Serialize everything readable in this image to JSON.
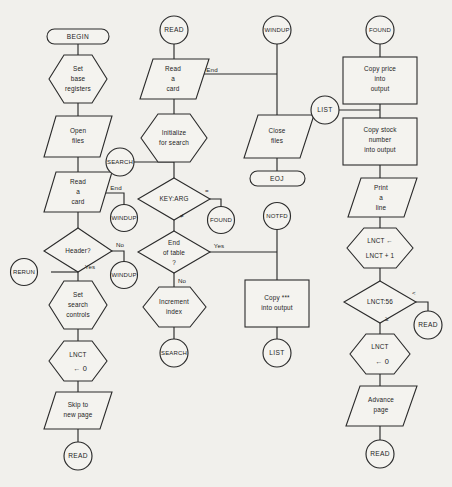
{
  "diagram": {
    "background_color": "#f1f0ec",
    "line_color": "#2b2b2b",
    "shape_fill": "#f4f3ef"
  },
  "columns": [
    {
      "name": "begin-column",
      "nodes": [
        {
          "id": "begin",
          "shape": "terminator",
          "lines": [
            "BEGIN"
          ]
        },
        {
          "id": "set-base-registers",
          "shape": "hexagon",
          "lines": [
            "Set",
            "base",
            "registers"
          ]
        },
        {
          "id": "open-files",
          "shape": "parallelogram",
          "lines": [
            "Open",
            "files"
          ]
        },
        {
          "id": "read-a-card-1",
          "shape": "parallelogram",
          "lines": [
            "Read",
            "a",
            "card"
          ]
        },
        {
          "id": "header-decision",
          "shape": "diamond",
          "lines": [
            "Header?"
          ]
        },
        {
          "id": "rerun",
          "shape": "connector",
          "lines": [
            "RERUN"
          ]
        },
        {
          "id": "windup-1",
          "shape": "connector",
          "lines": [
            "WINDUP"
          ]
        },
        {
          "id": "set-search-controls",
          "shape": "hexagon",
          "lines": [
            "Set",
            "search",
            "controls"
          ]
        },
        {
          "id": "lnct-zero-1",
          "shape": "hexagon",
          "lines": [
            "LNCT",
            "←     0"
          ]
        },
        {
          "id": "skip-to-new-page",
          "shape": "parallelogram",
          "lines": [
            "Skip to",
            "new page"
          ]
        },
        {
          "id": "read-1",
          "shape": "connector",
          "lines": [
            "READ"
          ]
        }
      ],
      "edge_labels": [
        "End",
        "No",
        "Yes"
      ]
    },
    {
      "name": "read-column",
      "nodes": [
        {
          "id": "read-2",
          "shape": "connector",
          "lines": [
            "READ"
          ]
        },
        {
          "id": "read-a-card-2",
          "shape": "parallelogram",
          "lines": [
            "Read",
            "a",
            "card"
          ]
        },
        {
          "id": "initialize-for-search",
          "shape": "hexagon",
          "lines": [
            "Initialize",
            "for  search"
          ]
        },
        {
          "id": "search-1",
          "shape": "connector",
          "lines": [
            "SEARCH"
          ]
        },
        {
          "id": "key-arg-decision",
          "shape": "diamond",
          "lines": [
            "KEY:ARG"
          ]
        },
        {
          "id": "found-1",
          "shape": "connector",
          "lines": [
            "FOUND"
          ]
        },
        {
          "id": "end-of-table-decision",
          "shape": "diamond",
          "lines": [
            "End",
            "of table",
            "?"
          ]
        },
        {
          "id": "increment-index",
          "shape": "hexagon",
          "lines": [
            "Increment",
            "index"
          ]
        },
        {
          "id": "search-2",
          "shape": "connector",
          "lines": [
            "SEARCH"
          ]
        }
      ],
      "edge_labels": [
        "End",
        "=",
        "≠",
        "Yes",
        "No"
      ]
    },
    {
      "name": "windup-column",
      "nodes": [
        {
          "id": "windup-2",
          "shape": "connector",
          "lines": [
            "WINDUP"
          ]
        },
        {
          "id": "close-files",
          "shape": "parallelogram",
          "lines": [
            "Close",
            "files"
          ]
        },
        {
          "id": "eoj",
          "shape": "terminator",
          "lines": [
            "EOJ"
          ]
        },
        {
          "id": "notfd",
          "shape": "connector",
          "lines": [
            "NOTFD"
          ]
        },
        {
          "id": "copy-stars-into-output",
          "shape": "rectangle",
          "lines": [
            "Copy ***",
            "into output"
          ]
        },
        {
          "id": "list-2",
          "shape": "connector",
          "lines": [
            "LIST"
          ]
        }
      ],
      "edge_labels": []
    },
    {
      "name": "found-column",
      "nodes": [
        {
          "id": "found-2",
          "shape": "connector",
          "lines": [
            "FOUND"
          ]
        },
        {
          "id": "copy-price-into-output",
          "shape": "rectangle",
          "lines": [
            "Copy price",
            "into",
            "output"
          ]
        },
        {
          "id": "list-1",
          "shape": "connector",
          "lines": [
            "LIST"
          ]
        },
        {
          "id": "copy-stock-number-into-output",
          "shape": "rectangle",
          "lines": [
            "Copy stock",
            "number",
            "into output"
          ]
        },
        {
          "id": "print-a-line",
          "shape": "parallelogram",
          "lines": [
            "Print",
            "a",
            "line"
          ]
        },
        {
          "id": "lnct-increment",
          "shape": "hexagon",
          "lines": [
            "LNCT   ←",
            "LNCT + 1"
          ]
        },
        {
          "id": "lnct-compare",
          "shape": "diamond",
          "lines": [
            "LNCT:56"
          ]
        },
        {
          "id": "read-3",
          "shape": "connector",
          "lines": [
            "READ"
          ]
        },
        {
          "id": "lnct-zero-2",
          "shape": "hexagon",
          "lines": [
            "LNCT",
            "←     0"
          ]
        },
        {
          "id": "advance-page",
          "shape": "parallelogram",
          "lines": [
            "Advance",
            "page"
          ]
        },
        {
          "id": "read-4",
          "shape": "connector",
          "lines": [
            "READ"
          ]
        }
      ],
      "edge_labels": [
        "<",
        "≥"
      ]
    }
  ],
  "text": {
    "begin": "BEGIN",
    "set_base_1": "Set",
    "set_base_2": "base",
    "set_base_3": "registers",
    "open_1": "Open",
    "open_2": "files",
    "read_card1_1": "Read",
    "read_card1_2": "a",
    "read_card1_3": "card",
    "end_label_1": "End",
    "windup_conn_1": "WINDUP",
    "header_q": "Header?",
    "no_label_1": "No",
    "yes_label_1": "Yes",
    "rerun": "RERUN",
    "set_search_1": "Set",
    "set_search_2": "search",
    "set_search_3": "controls",
    "lnct_a_1": "LNCT",
    "lnct_a_2": "←     0",
    "skip_1": "Skip to",
    "skip_2": "new page",
    "read_term_1": "READ",
    "read_conn_2": "READ",
    "read_card2_1": "Read",
    "read_card2_2": "a",
    "read_card2_3": "card",
    "end_label_2": "End",
    "init_1": "Initialize",
    "init_2": "for  search",
    "search_conn_1": "SEARCH",
    "key_arg": "KEY:ARG",
    "eq_label": "=",
    "neq_label": "≠",
    "found_conn_1": "FOUND",
    "eot_1": "End",
    "eot_2": "of table",
    "eot_3": "?",
    "yes_label_2": "Yes",
    "no_label_2": "No",
    "increment_1": "Increment",
    "increment_2": "index",
    "search_conn_2": "SEARCH",
    "windup_conn_2": "WINDUP",
    "close_1": "Close",
    "close_2": "files",
    "eoj": "EOJ",
    "notfd": "NOTFD",
    "copy_stars_1": "Copy ***",
    "copy_stars_2": "into output",
    "list_conn_2": "LIST",
    "found_conn_2": "FOUND",
    "copy_price_1": "Copy price",
    "copy_price_2": "into",
    "copy_price_3": "output",
    "list_conn_1": "LIST",
    "copy_stock_1": "Copy stock",
    "copy_stock_2": "number",
    "copy_stock_3": "into output",
    "print_1": "Print",
    "print_2": "a",
    "print_3": "line",
    "lnct_inc_1": "LNCT   ←",
    "lnct_inc_2": "LNCT + 1",
    "lnct_cmp": "LNCT:56",
    "lt_label": "<",
    "ge_label": "≥",
    "read_conn_3": "READ",
    "lnct_b_1": "LNCT",
    "lnct_b_2": "←     0",
    "advance_1": "Advance",
    "advance_2": "page",
    "read_conn_4": "READ"
  }
}
